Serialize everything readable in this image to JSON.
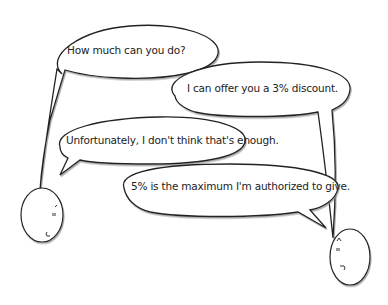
{
  "dialogue": [
    {
      "speaker": "left",
      "text": "How much can you do?"
    },
    {
      "speaker": "right",
      "text": "I can offer you a 3% discount."
    },
    {
      "speaker": "left",
      "text": "Unfortunately, I don't think that's enough."
    },
    {
      "speaker": "right",
      "text": "5% is the maximum I'm authorized to give."
    }
  ],
  "characters": {
    "left": {
      "eyes": "\"",
      "mouth": "⌐",
      "brow": "ʌ"
    },
    "right": {
      "eyes": "\"",
      "mouth": "⌐",
      "brow": "ʌ"
    }
  },
  "colors": {
    "stroke": "#222222",
    "fill": "#ffffff",
    "shadow": "#9a9a9a"
  }
}
